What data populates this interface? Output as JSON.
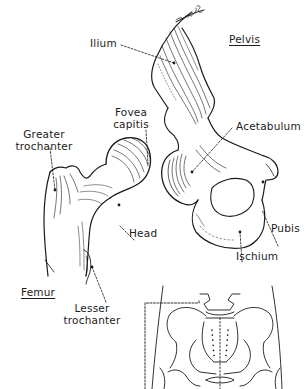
{
  "diagram": {
    "type": "anatomical-illustration",
    "signature": "McCaleb",
    "titles": {
      "pelvis": "Pelvis",
      "femur": "Femur"
    },
    "labels": {
      "ilium": "Ilium",
      "fovea_line1": "Fovea",
      "fovea_line2": "capitis",
      "greater_line1": "Greater",
      "greater_line2": "trochanter",
      "acetabulum": "Acetabulum",
      "head": "Head",
      "pubis": "Pubis",
      "ischium": "Ischium",
      "lesser_line1": "Lesser",
      "lesser_line2": "trochanter"
    },
    "inset": {
      "description": "Front view of pelvis with dashed box indicating enlarged region"
    },
    "colors": {
      "ink": "#1a1a1a",
      "background": "#ffffff"
    }
  }
}
